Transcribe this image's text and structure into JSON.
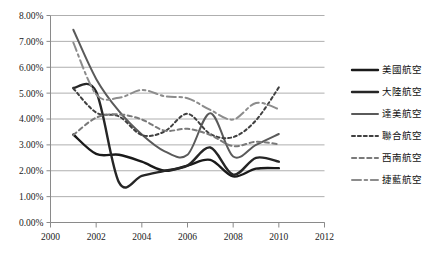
{
  "chart_data": {
    "type": "line",
    "title": "",
    "subtitle": "",
    "xlabel": "",
    "ylabel": "",
    "xlim": [
      2000,
      2012
    ],
    "ylim": [
      0,
      0.08
    ],
    "grid": true,
    "legend_position": "right",
    "x_ticks": [
      "2000",
      "2002",
      "2004",
      "2006",
      "2008",
      "2010",
      "2012"
    ],
    "x_tick_values": [
      2000,
      2002,
      2004,
      2006,
      2008,
      2010,
      2012
    ],
    "y_ticks": [
      "0.00%",
      "1.00%",
      "2.00%",
      "3.00%",
      "4.00%",
      "5.00%",
      "6.00%",
      "7.00%",
      "8.00%"
    ],
    "y_tick_values": [
      0,
      1,
      2,
      3,
      4,
      5,
      6,
      7,
      8
    ],
    "x": [
      2001,
      2002,
      2003,
      2004,
      2005,
      2006,
      2007,
      2008,
      2009,
      2010
    ],
    "series": [
      {
        "name": "美國航空",
        "color": "#1a1a1a",
        "width": 2.4,
        "dash": "none",
        "values": [
          3.4,
          2.65,
          2.62,
          2.35,
          2.0,
          2.2,
          2.42,
          1.78,
          2.08,
          2.1
        ]
      },
      {
        "name": "大陸航空",
        "color": "#262626",
        "width": 2.4,
        "dash": "none",
        "values": [
          5.2,
          5.05,
          1.55,
          1.8,
          2.0,
          2.2,
          2.9,
          1.85,
          2.5,
          2.35
        ]
      },
      {
        "name": "達美航空",
        "color": "#5a5a5a",
        "width": 2.0,
        "dash": "none",
        "values": [
          7.45,
          5.55,
          4.3,
          3.4,
          2.75,
          2.62,
          4.22,
          2.55,
          3.0,
          3.42
        ]
      },
      {
        "name": "聯合航空",
        "color": "#404040",
        "width": 2.0,
        "dash": "dotted",
        "values": [
          5.18,
          4.25,
          4.1,
          3.38,
          3.52,
          4.2,
          3.42,
          3.3,
          3.95,
          5.22
        ]
      },
      {
        "name": "西南航空",
        "color": "#7a7a7a",
        "width": 2.0,
        "dash": "dashed",
        "values": [
          3.38,
          4.05,
          4.18,
          3.98,
          3.55,
          3.62,
          3.38,
          2.95,
          3.12,
          3.02
        ]
      },
      {
        "name": "捷藍航空",
        "color": "#8c8c8c",
        "width": 2.0,
        "dash": "dashdot",
        "values": [
          6.95,
          4.95,
          4.82,
          5.12,
          4.88,
          4.8,
          4.35,
          3.98,
          4.62,
          4.38
        ]
      }
    ]
  }
}
